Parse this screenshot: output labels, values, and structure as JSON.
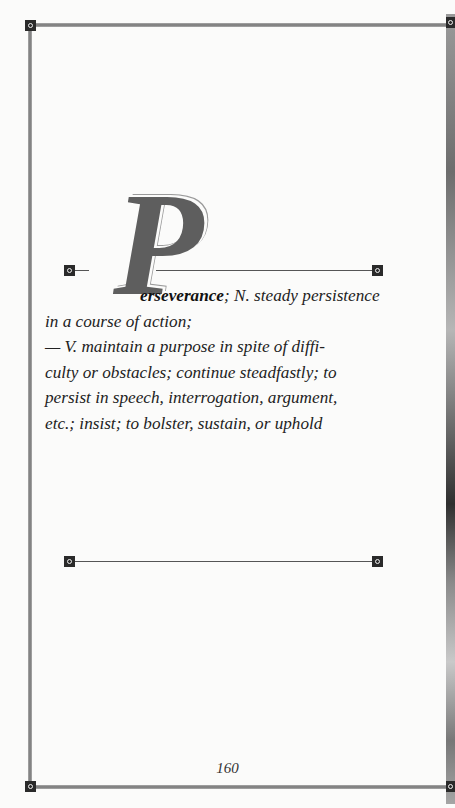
{
  "entry": {
    "drop_cap": "P",
    "headword": "erseverance",
    "first_line_rest": "; N. steady persistence",
    "lines": [
      "in a course of action;",
      "— V. maintain a purpose in spite of diffi-",
      "culty or obstacles; continue steadfastly; to",
      "persist in speech, interrogation, argument,",
      "etc.; insist; to bolster, sustain, or uphold"
    ]
  },
  "page_number": "160",
  "colors": {
    "frame": "#8c8c8c",
    "marker": "#2a2a2a",
    "drop_cap": "#5e5e5e",
    "text": "#222222"
  }
}
